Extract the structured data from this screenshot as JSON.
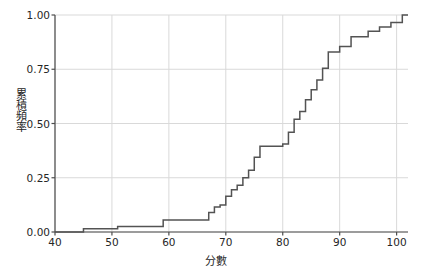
{
  "chart_data": {
    "type": "line",
    "subtype": "ecdf-step",
    "title": "",
    "xlabel": "分數",
    "ylabel": "累積頻率",
    "xlim": [
      40,
      102
    ],
    "ylim": [
      0.0,
      1.0
    ],
    "grid": true,
    "legend": null,
    "line_color": "#535353",
    "grid_color": "#d9d9d9",
    "axis_color": "#4d4d4d",
    "background_color": "#ffffff",
    "xticks": [
      40,
      50,
      60,
      70,
      80,
      90,
      100
    ],
    "xtick_labels": [
      "40",
      "50",
      "60",
      "70",
      "80",
      "90",
      "100"
    ],
    "yticks": [
      0.0,
      0.25,
      0.5,
      0.75,
      1.0
    ],
    "ytick_labels": [
      "0.00",
      "0.25",
      "0.50",
      "0.75",
      "1.00"
    ],
    "series": [
      {
        "name": "累積頻率",
        "x": [
          40,
          45,
          45,
          51,
          51,
          59,
          59,
          67,
          67,
          68,
          68,
          69,
          69,
          70,
          70,
          71,
          71,
          72,
          72,
          73,
          73,
          74,
          74,
          75,
          75,
          76,
          76,
          80,
          80,
          81,
          81,
          82,
          82,
          83,
          83,
          84,
          84,
          85,
          85,
          86,
          86,
          87,
          87,
          88,
          88,
          90,
          90,
          92,
          92,
          95,
          95,
          97,
          97,
          99,
          99,
          101,
          101,
          102
        ],
        "y": [
          0.0,
          0.0,
          0.015,
          0.015,
          0.025,
          0.025,
          0.055,
          0.055,
          0.09,
          0.09,
          0.115,
          0.115,
          0.125,
          0.125,
          0.165,
          0.165,
          0.195,
          0.195,
          0.215,
          0.215,
          0.25,
          0.25,
          0.285,
          0.285,
          0.345,
          0.345,
          0.395,
          0.395,
          0.405,
          0.405,
          0.46,
          0.46,
          0.52,
          0.52,
          0.555,
          0.555,
          0.61,
          0.61,
          0.655,
          0.655,
          0.7,
          0.7,
          0.755,
          0.755,
          0.83,
          0.83,
          0.855,
          0.855,
          0.9,
          0.9,
          0.925,
          0.925,
          0.945,
          0.945,
          0.965,
          0.965,
          1.0,
          1.0
        ]
      }
    ]
  }
}
